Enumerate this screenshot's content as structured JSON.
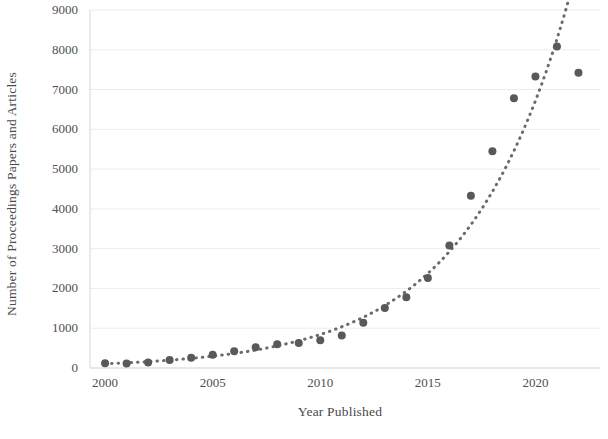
{
  "chart_data": {
    "type": "scatter",
    "title": "",
    "xlabel": "Year Published",
    "ylabel": "Number of Proceedings Papers and Articles",
    "xlim": [
      1999.3,
      2023.0
    ],
    "ylim": [
      0,
      9000
    ],
    "grid": true,
    "grid_axis": "y",
    "legend": "none",
    "x_tick_labels": [
      "2000",
      "2005",
      "2010",
      "2015",
      "2020"
    ],
    "x_ticks": [
      2000,
      2005,
      2010,
      2015,
      2020
    ],
    "y_tick_labels": [
      "0",
      "1000",
      "2000",
      "3000",
      "4000",
      "5000",
      "6000",
      "7000",
      "8000",
      "9000"
    ],
    "y_ticks": [
      0,
      1000,
      2000,
      3000,
      4000,
      5000,
      6000,
      7000,
      8000,
      9000
    ],
    "marker": {
      "shape": "circle",
      "color": "#595959",
      "size": 8
    },
    "trendline": {
      "style": "dotted",
      "color": "#6b6b6b",
      "type": "exponential",
      "label": ""
    },
    "x": [
      2000,
      2001,
      2002,
      2003,
      2004,
      2005,
      2006,
      2007,
      2008,
      2009,
      2010,
      2011,
      2012,
      2013,
      2014,
      2015,
      2016,
      2017,
      2018,
      2019,
      2020,
      2021,
      2022
    ],
    "values": [
      120,
      110,
      140,
      200,
      260,
      330,
      420,
      520,
      600,
      630,
      700,
      820,
      1140,
      1510,
      1780,
      2260,
      3080,
      4330,
      5450,
      6780,
      7330,
      8080,
      7420
    ],
    "series": [
      {
        "name": "Proceedings papers and articles",
        "values": [
          120,
          110,
          140,
          200,
          260,
          330,
          420,
          520,
          600,
          630,
          700,
          820,
          1140,
          1510,
          1780,
          2260,
          3080,
          4330,
          5450,
          6780,
          7330,
          8080,
          7420
        ]
      }
    ]
  }
}
